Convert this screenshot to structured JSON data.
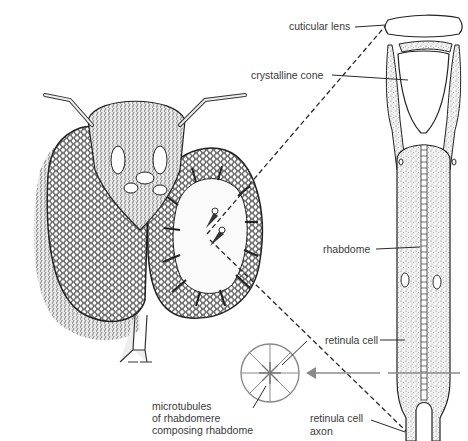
{
  "diagram": {
    "labels": {
      "cuticular_lens": "cuticular lens",
      "crystalline_cone": "crystalline cone",
      "rhabdome": "rhabdome",
      "retinula_cell": "retinula cell",
      "retinula_cell_axon_line1": "retinula cell",
      "retinula_cell_axon_line2": "axon",
      "microtubules_line1": "microtubules",
      "microtubules_line2": "of rhabdomere",
      "microtubules_line3": "composing rhabdome"
    },
    "colors": {
      "ink": "#2a2a2a",
      "label_text": "#3a3a3a",
      "cross_section": "#8a8a8a",
      "stipple": "#d8d8d8",
      "background": "#ffffff"
    }
  }
}
